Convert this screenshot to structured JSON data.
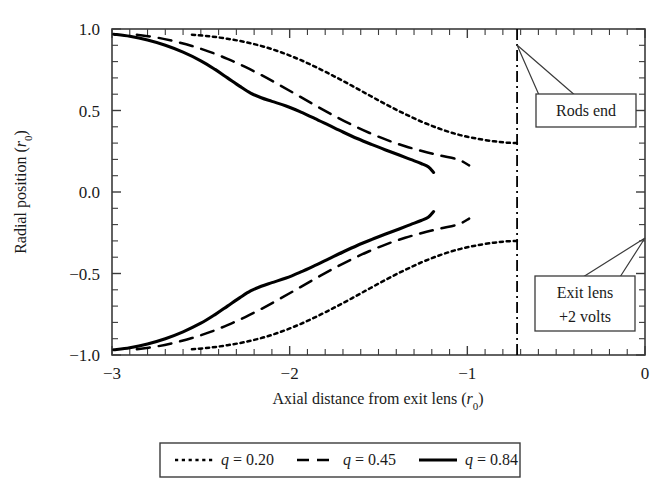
{
  "chart_data": {
    "type": "line",
    "title": "",
    "xlabel": "Axial distance from exit lens (r₀)",
    "ylabel": "Radial position (r₀)",
    "xlabel_main": "Axial distance from exit lens (",
    "xlabel_var": "r",
    "xlabel_sub": "0",
    "xlabel_close": ")",
    "ylabel_main": "Radial position (",
    "ylabel_var": "r",
    "ylabel_sub": "0",
    "ylabel_close": ")",
    "xlim": [
      -3,
      0
    ],
    "ylim": [
      -1.0,
      1.0
    ],
    "grid": false,
    "xticks": [
      -3,
      -2,
      -1,
      0
    ],
    "xticklabels": [
      "−3",
      "−2",
      "−1",
      "0"
    ],
    "yticks": [
      1.0,
      0.5,
      0.0,
      -0.5,
      -1.0
    ],
    "yticklabels": [
      "1.0",
      "0.5",
      "0.0",
      "−0.5",
      "−1.0"
    ],
    "x_minor_step": 0.1,
    "y_minor_step": 0.1,
    "legend_position": "below-axes",
    "series": [
      {
        "name": "q = 0.20",
        "style": "dotted",
        "q": 0.2,
        "branch": "upper",
        "points": [
          [
            -2.55,
            0.965
          ],
          [
            -2.45,
            0.955
          ],
          [
            -2.35,
            0.94
          ],
          [
            -2.25,
            0.92
          ],
          [
            -2.15,
            0.893
          ],
          [
            -2.05,
            0.858
          ],
          [
            -1.95,
            0.815
          ],
          [
            -1.85,
            0.765
          ],
          [
            -1.75,
            0.71
          ],
          [
            -1.65,
            0.652
          ],
          [
            -1.55,
            0.592
          ],
          [
            -1.45,
            0.533
          ],
          [
            -1.35,
            0.478
          ],
          [
            -1.25,
            0.428
          ],
          [
            -1.15,
            0.386
          ],
          [
            -1.05,
            0.352
          ],
          [
            -0.95,
            0.328
          ],
          [
            -0.85,
            0.311
          ],
          [
            -0.78,
            0.303
          ],
          [
            -0.72,
            0.3
          ]
        ]
      },
      {
        "name": "q = 0.45",
        "style": "dashed",
        "q": 0.45,
        "branch": "upper",
        "points": [
          [
            -2.86,
            0.965
          ],
          [
            -2.75,
            0.948
          ],
          [
            -2.65,
            0.925
          ],
          [
            -2.55,
            0.896
          ],
          [
            -2.45,
            0.86
          ],
          [
            -2.35,
            0.817
          ],
          [
            -2.25,
            0.767
          ],
          [
            -2.15,
            0.712
          ],
          [
            -2.05,
            0.652
          ],
          [
            -1.95,
            0.59
          ],
          [
            -1.85,
            0.528
          ],
          [
            -1.75,
            0.468
          ],
          [
            -1.65,
            0.412
          ],
          [
            -1.55,
            0.362
          ],
          [
            -1.45,
            0.318
          ],
          [
            -1.35,
            0.281
          ],
          [
            -1.25,
            0.25
          ],
          [
            -1.15,
            0.223
          ],
          [
            -1.05,
            0.198
          ],
          [
            -0.99,
            0.163
          ]
        ]
      },
      {
        "name": "q = 0.84",
        "style": "solid",
        "q": 0.84,
        "branch": "upper",
        "points": [
          [
            -2.99,
            0.968
          ],
          [
            -2.9,
            0.955
          ],
          [
            -2.8,
            0.932
          ],
          [
            -2.7,
            0.9
          ],
          [
            -2.6,
            0.858
          ],
          [
            -2.5,
            0.805
          ],
          [
            -2.42,
            0.752
          ],
          [
            -2.35,
            0.7
          ],
          [
            -2.28,
            0.648
          ],
          [
            -2.22,
            0.607
          ],
          [
            -2.16,
            0.578
          ],
          [
            -2.1,
            0.556
          ],
          [
            -2.02,
            0.528
          ],
          [
            -1.94,
            0.492
          ],
          [
            -1.86,
            0.452
          ],
          [
            -1.78,
            0.41
          ],
          [
            -1.7,
            0.368
          ],
          [
            -1.62,
            0.328
          ],
          [
            -1.54,
            0.292
          ],
          [
            -1.46,
            0.258
          ],
          [
            -1.38,
            0.225
          ],
          [
            -1.32,
            0.2
          ],
          [
            -1.26,
            0.175
          ],
          [
            -1.22,
            0.155
          ],
          [
            -1.19,
            0.12
          ]
        ]
      },
      {
        "name": "q = 0.20",
        "style": "dotted",
        "q": 0.2,
        "branch": "lower",
        "points": [
          [
            -2.55,
            -0.965
          ],
          [
            -2.45,
            -0.955
          ],
          [
            -2.35,
            -0.94
          ],
          [
            -2.25,
            -0.92
          ],
          [
            -2.15,
            -0.893
          ],
          [
            -2.05,
            -0.858
          ],
          [
            -1.95,
            -0.815
          ],
          [
            -1.85,
            -0.765
          ],
          [
            -1.75,
            -0.71
          ],
          [
            -1.65,
            -0.652
          ],
          [
            -1.55,
            -0.592
          ],
          [
            -1.45,
            -0.533
          ],
          [
            -1.35,
            -0.478
          ],
          [
            -1.25,
            -0.428
          ],
          [
            -1.15,
            -0.386
          ],
          [
            -1.05,
            -0.352
          ],
          [
            -0.95,
            -0.328
          ],
          [
            -0.85,
            -0.311
          ],
          [
            -0.78,
            -0.303
          ],
          [
            -0.72,
            -0.3
          ]
        ]
      },
      {
        "name": "q = 0.45",
        "style": "dashed",
        "q": 0.45,
        "branch": "lower",
        "points": [
          [
            -2.86,
            -0.965
          ],
          [
            -2.75,
            -0.948
          ],
          [
            -2.65,
            -0.925
          ],
          [
            -2.55,
            -0.896
          ],
          [
            -2.45,
            -0.86
          ],
          [
            -2.35,
            -0.817
          ],
          [
            -2.25,
            -0.767
          ],
          [
            -2.15,
            -0.712
          ],
          [
            -2.05,
            -0.652
          ],
          [
            -1.95,
            -0.59
          ],
          [
            -1.85,
            -0.528
          ],
          [
            -1.75,
            -0.468
          ],
          [
            -1.65,
            -0.412
          ],
          [
            -1.55,
            -0.362
          ],
          [
            -1.45,
            -0.318
          ],
          [
            -1.35,
            -0.281
          ],
          [
            -1.25,
            -0.25
          ],
          [
            -1.15,
            -0.223
          ],
          [
            -1.05,
            -0.198
          ],
          [
            -0.99,
            -0.163
          ]
        ]
      },
      {
        "name": "q = 0.84",
        "style": "solid",
        "q": 0.84,
        "branch": "lower",
        "points": [
          [
            -2.99,
            -0.968
          ],
          [
            -2.9,
            -0.955
          ],
          [
            -2.8,
            -0.932
          ],
          [
            -2.7,
            -0.9
          ],
          [
            -2.6,
            -0.858
          ],
          [
            -2.5,
            -0.805
          ],
          [
            -2.42,
            -0.752
          ],
          [
            -2.35,
            -0.7
          ],
          [
            -2.28,
            -0.648
          ],
          [
            -2.22,
            -0.607
          ],
          [
            -2.16,
            -0.578
          ],
          [
            -2.1,
            -0.556
          ],
          [
            -2.02,
            -0.528
          ],
          [
            -1.94,
            -0.492
          ],
          [
            -1.86,
            -0.452
          ],
          [
            -1.78,
            -0.41
          ],
          [
            -1.7,
            -0.368
          ],
          [
            -1.62,
            -0.328
          ],
          [
            -1.54,
            -0.292
          ],
          [
            -1.46,
            -0.258
          ],
          [
            -1.38,
            -0.225
          ],
          [
            -1.32,
            -0.2
          ],
          [
            -1.26,
            -0.175
          ],
          [
            -1.22,
            -0.155
          ],
          [
            -1.19,
            -0.12
          ]
        ]
      }
    ],
    "annotations": [
      {
        "name": "rods-end",
        "text": "Rods end",
        "lines": [
          "Rods end"
        ],
        "target_x": -0.72,
        "target_y": 0.87
      },
      {
        "name": "exit-lens",
        "text": "Exit lens +2 volts",
        "lines": [
          "Exit lens",
          "+2 volts"
        ],
        "target_x": 0,
        "target_y": -0.2
      }
    ],
    "reference_line": {
      "name": "rods-end-line",
      "x": -0.72,
      "style": "dash-dot"
    }
  },
  "legend": {
    "entries": [
      {
        "var": "q",
        "eq": " = ",
        "value": "0.20",
        "style": "dotted"
      },
      {
        "var": "q",
        "eq": " = ",
        "value": "0.45",
        "style": "dashed"
      },
      {
        "var": "q",
        "eq": " = ",
        "value": "0.84",
        "style": "solid"
      }
    ]
  },
  "colors": {
    "curve": "#000000",
    "axis": "#3b3b3b",
    "text": "#1a1a1a",
    "background": "#ffffff"
  }
}
